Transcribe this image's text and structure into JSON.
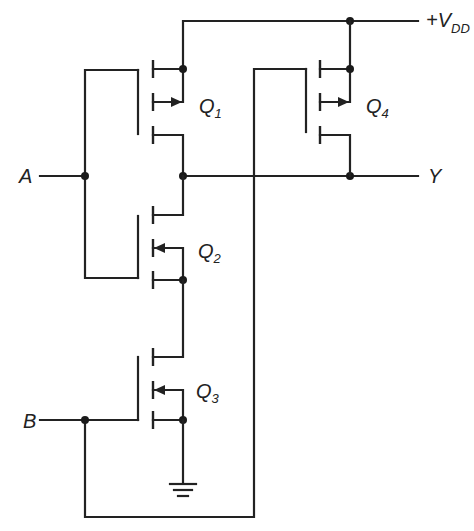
{
  "diagram": {
    "supply_label": "+V",
    "supply_subscript": "DD",
    "inputs": [
      {
        "label": "A"
      },
      {
        "label": "B"
      }
    ],
    "output": {
      "label": "Y"
    },
    "transistors": [
      {
        "label": "Q",
        "subscript": "1",
        "type": "PMOS"
      },
      {
        "label": "Q",
        "subscript": "2",
        "type": "NMOS"
      },
      {
        "label": "Q",
        "subscript": "3",
        "type": "NMOS"
      },
      {
        "label": "Q",
        "subscript": "4",
        "type": "PMOS"
      }
    ],
    "ground_symbol": "ground-icon",
    "colors": {
      "ink": "#222222",
      "background": "#ffffff"
    }
  }
}
